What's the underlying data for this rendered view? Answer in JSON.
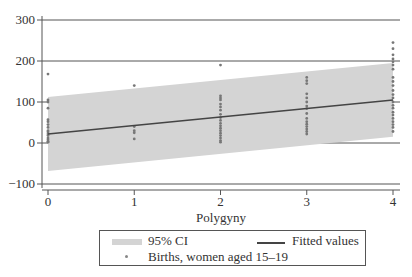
{
  "chart_data": {
    "type": "scatter",
    "title": "",
    "xlabel": "Polygyny",
    "ylabel": "",
    "xlim": [
      0,
      4
    ],
    "ylim": [
      -100,
      300
    ],
    "x_ticks": [
      "0",
      "1",
      "2",
      "3",
      "4"
    ],
    "y_ticks": [
      "300",
      "200",
      "100",
      "0",
      "−100"
    ],
    "grid": true,
    "legend_position": "bottom",
    "legend": [
      "95% CI",
      "Fitted values",
      "Births, women aged 15–19"
    ],
    "series": [
      {
        "name": "Births, women aged 15–19",
        "type": "scatter",
        "points": [
          [
            0,
            168
          ],
          [
            0,
            105
          ],
          [
            0,
            100
          ],
          [
            0,
            85
          ],
          [
            0,
            57
          ],
          [
            0,
            52
          ],
          [
            0,
            45
          ],
          [
            0,
            38
          ],
          [
            0,
            30
          ],
          [
            0,
            27
          ],
          [
            0,
            22
          ],
          [
            0,
            18
          ],
          [
            0,
            12
          ],
          [
            0,
            8
          ],
          [
            0,
            4
          ],
          [
            0,
            2
          ],
          [
            1,
            140
          ],
          [
            1,
            40
          ],
          [
            1,
            30
          ],
          [
            1,
            25
          ],
          [
            1,
            10
          ],
          [
            2,
            190
          ],
          [
            2,
            115
          ],
          [
            2,
            110
          ],
          [
            2,
            105
          ],
          [
            2,
            95
          ],
          [
            2,
            88
          ],
          [
            2,
            80
          ],
          [
            2,
            70
          ],
          [
            2,
            62
          ],
          [
            2,
            55
          ],
          [
            2,
            48
          ],
          [
            2,
            42
          ],
          [
            2,
            36
          ],
          [
            2,
            30
          ],
          [
            2,
            24
          ],
          [
            2,
            18
          ],
          [
            2,
            12
          ],
          [
            2,
            6
          ],
          [
            2,
            2
          ],
          [
            3,
            160
          ],
          [
            3,
            152
          ],
          [
            3,
            145
          ],
          [
            3,
            120
          ],
          [
            3,
            110
          ],
          [
            3,
            100
          ],
          [
            3,
            90
          ],
          [
            3,
            84
          ],
          [
            3,
            72
          ],
          [
            3,
            60
          ],
          [
            3,
            52
          ],
          [
            3,
            46
          ],
          [
            3,
            40
          ],
          [
            3,
            34
          ],
          [
            3,
            28
          ],
          [
            3,
            22
          ],
          [
            4,
            245
          ],
          [
            4,
            230
          ],
          [
            4,
            215
          ],
          [
            4,
            205
          ],
          [
            4,
            198
          ],
          [
            4,
            190
          ],
          [
            4,
            180
          ],
          [
            4,
            160
          ],
          [
            4,
            150
          ],
          [
            4,
            140
          ],
          [
            4,
            128
          ],
          [
            4,
            118
          ],
          [
            4,
            110
          ],
          [
            4,
            100
          ],
          [
            4,
            92
          ],
          [
            4,
            85
          ],
          [
            4,
            75
          ],
          [
            4,
            68
          ],
          [
            4,
            60
          ],
          [
            4,
            52
          ],
          [
            4,
            45
          ],
          [
            4,
            38
          ],
          [
            4,
            28
          ]
        ]
      },
      {
        "name": "Fitted values",
        "type": "line",
        "x": [
          0,
          4
        ],
        "values": [
          22,
          105
        ]
      },
      {
        "name": "95% CI",
        "type": "area",
        "x": [
          0,
          4
        ],
        "lower": [
          -68,
          15
        ],
        "upper": [
          112,
          195
        ]
      }
    ]
  },
  "legend": {
    "ci_label": "95% CI",
    "fitted_label": "Fitted values",
    "points_label": "Births, women aged 15–19"
  },
  "colors": {
    "ci_fill": "#d4d4d4",
    "fitted_line": "#444444",
    "points": "#777777",
    "grid": "#555555"
  }
}
